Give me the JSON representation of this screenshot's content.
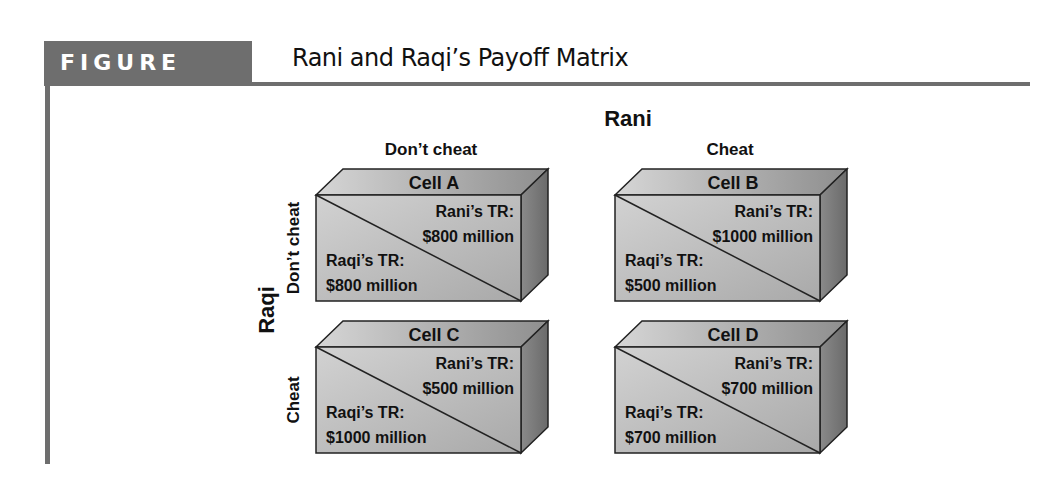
{
  "figure": {
    "badge": "FIGURE 11.7",
    "title": "Rani and Raqi’s Payoff Matrix"
  },
  "matrix": {
    "column_player": "Rani",
    "row_player": "Raqi",
    "columns": [
      "Don’t cheat",
      "Cheat"
    ],
    "rows": [
      "Don’t cheat",
      "Cheat"
    ],
    "cells": [
      {
        "name": "Cell A",
        "rani_label": "Rani’s TR:",
        "rani_value": "$800 million",
        "raqi_label": "Raqi’s TR:",
        "raqi_value": "$800 million"
      },
      {
        "name": "Cell B",
        "rani_label": "Rani’s TR:",
        "rani_value": "$1000 million",
        "raqi_label": "Raqi’s TR:",
        "raqi_value": "$500 million"
      },
      {
        "name": "Cell C",
        "rani_label": "Rani’s TR:",
        "rani_value": "$500 million",
        "raqi_label": "Raqi’s TR:",
        "raqi_value": "$1000 million"
      },
      {
        "name": "Cell D",
        "rani_label": "Rani’s TR:",
        "rani_value": "$700 million",
        "raqi_label": "Raqi’s TR:",
        "raqi_value": "$700 million"
      }
    ]
  },
  "colors": {
    "rule": "#6e6e6e",
    "top_face": "#b8b8b8",
    "front_face": "#c9c9c9",
    "side_face": "#7a7a7a"
  }
}
